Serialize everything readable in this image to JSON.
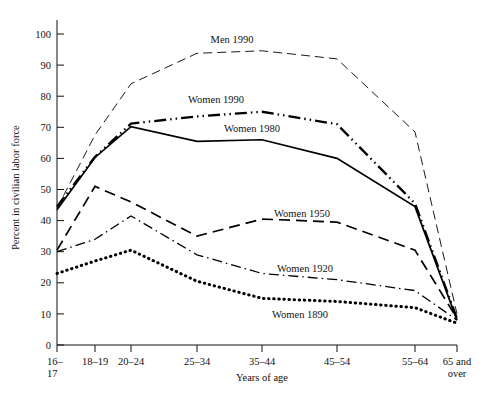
{
  "chart_data": {
    "type": "line",
    "title": "",
    "xlabel": "Years of age",
    "ylabel": "Percent in civilian labor force",
    "categories": [
      "16-17",
      "18-19",
      "20-24",
      "25-34",
      "35-44",
      "45-54",
      "55-64",
      "65 and over"
    ],
    "tick_labels": [
      "16–",
      "18–19",
      "20–24",
      "25–34",
      "35–44",
      "45–54",
      "55–64",
      "65 and"
    ],
    "tick_labels_line2": [
      "17",
      "",
      "",
      "",
      "",
      "",
      "",
      "over"
    ],
    "ylim": [
      0,
      105
    ],
    "yticks": [
      0,
      10,
      20,
      30,
      40,
      50,
      60,
      70,
      80,
      90,
      100
    ],
    "grid": false,
    "legend": "inline-annotations",
    "series": [
      {
        "name": "Men 1990",
        "label": "Men 1990",
        "style": "long-dash",
        "stroke_width": 0.9,
        "values": [
          44.0,
          67.5,
          84.0,
          93.8,
          94.6,
          92.0,
          68.5,
          10.0
        ]
      },
      {
        "name": "Women 1990",
        "label": "Women 1990",
        "style": "dash-dot-dot",
        "stroke_width": 2.3,
        "values": [
          44.5,
          60.5,
          71.2,
          73.5,
          75.0,
          71.0,
          45.5,
          8.5
        ]
      },
      {
        "name": "Women 1980",
        "label": "Women 1980",
        "style": "solid",
        "stroke_width": 1.7,
        "values": [
          43.5,
          60.3,
          70.2,
          65.5,
          66.0,
          60.0,
          44.5,
          8.0
        ]
      },
      {
        "name": "Women 1950",
        "label": "Women 1950",
        "style": "dashed",
        "stroke_width": 1.7,
        "values": [
          30.5,
          51.0,
          46.0,
          35.0,
          40.5,
          39.5,
          30.5,
          8.5
        ]
      },
      {
        "name": "Women 1920",
        "label": "Women 1920",
        "style": "dash-dot",
        "stroke_width": 1.3,
        "values": [
          30.0,
          34.0,
          41.5,
          29.0,
          23.0,
          21.0,
          17.5,
          8.0
        ]
      },
      {
        "name": "Women 1890",
        "label": "Women 1890",
        "style": "dotted",
        "stroke_width": 3.0,
        "values": [
          23.0,
          27.0,
          30.5,
          20.5,
          15.0,
          14.0,
          12.0,
          7.0
        ]
      }
    ],
    "annotations": [
      {
        "text": "Men 1990",
        "x": 232,
        "y": 43
      },
      {
        "text": "Women 1990",
        "x": 216,
        "y": 103
      },
      {
        "text": "Women 1980",
        "x": 252,
        "y": 132
      },
      {
        "text": "Women 1950",
        "x": 302,
        "y": 217
      },
      {
        "text": "Women 1920",
        "x": 305,
        "y": 272
      },
      {
        "text": "Women 1890",
        "x": 300,
        "y": 318
      }
    ]
  }
}
